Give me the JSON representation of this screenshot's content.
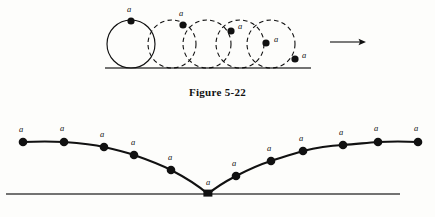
{
  "figure": {
    "caption": "Figure 5-22",
    "point_label": "a",
    "ink_color": "#111111",
    "baseline_color": "#444444",
    "background": "#fdfdfb"
  },
  "top_panel": {
    "name": "rolling-circle-sequence",
    "baseline": {
      "x1": 105,
      "x2": 311,
      "y": 68
    },
    "circle_radius": 24,
    "circles": [
      {
        "cx": 131,
        "cy": 44,
        "style": "solid"
      },
      {
        "cx": 172,
        "cy": 44,
        "style": "dashed"
      },
      {
        "cx": 207,
        "cy": 44,
        "style": "dashed"
      },
      {
        "cx": 240,
        "cy": 44,
        "style": "dashed"
      },
      {
        "cx": 271,
        "cy": 44,
        "style": "dashed"
      }
    ],
    "marked_points": [
      {
        "cx": 131,
        "cy": 21,
        "label_x": 129,
        "label_y": 12
      },
      {
        "cx": 183,
        "cy": 25,
        "label_x": 181,
        "label_y": 16
      },
      {
        "cx": 231,
        "cy": 31,
        "label_x": 240,
        "label_y": 29
      },
      {
        "cx": 266,
        "cy": 43,
        "label_x": 276,
        "label_y": 42
      },
      {
        "cx": 295,
        "cy": 59,
        "label_x": 304,
        "label_y": 58
      }
    ],
    "direction_arrow": {
      "x1": 330,
      "x2": 366,
      "y": 42,
      "name": "motion-direction-arrow"
    }
  },
  "bottom_panel": {
    "name": "cycloid-trace",
    "baseline": {
      "x1": 6,
      "x2": 400,
      "y": 194
    },
    "cusp": {
      "x": 208,
      "y": 194
    },
    "curve_points": [
      {
        "x": 23,
        "y": 142
      },
      {
        "x": 64,
        "y": 142
      },
      {
        "x": 104,
        "y": 147
      },
      {
        "x": 134,
        "y": 155
      },
      {
        "x": 171,
        "y": 170
      },
      {
        "x": 208,
        "y": 194
      },
      {
        "x": 236,
        "y": 176
      },
      {
        "x": 271,
        "y": 161
      },
      {
        "x": 303,
        "y": 151
      },
      {
        "x": 343,
        "y": 145
      },
      {
        "x": 378,
        "y": 142
      },
      {
        "x": 418,
        "y": 142
      }
    ],
    "labels": [
      {
        "x": 21,
        "y": 132
      },
      {
        "x": 62,
        "y": 131
      },
      {
        "x": 102,
        "y": 137
      },
      {
        "x": 133,
        "y": 145
      },
      {
        "x": 170,
        "y": 160
      },
      {
        "x": 208,
        "y": 185
      },
      {
        "x": 234,
        "y": 166
      },
      {
        "x": 269,
        "y": 151
      },
      {
        "x": 301,
        "y": 141
      },
      {
        "x": 341,
        "y": 135
      },
      {
        "x": 376,
        "y": 131
      },
      {
        "x": 416,
        "y": 131
      }
    ]
  }
}
